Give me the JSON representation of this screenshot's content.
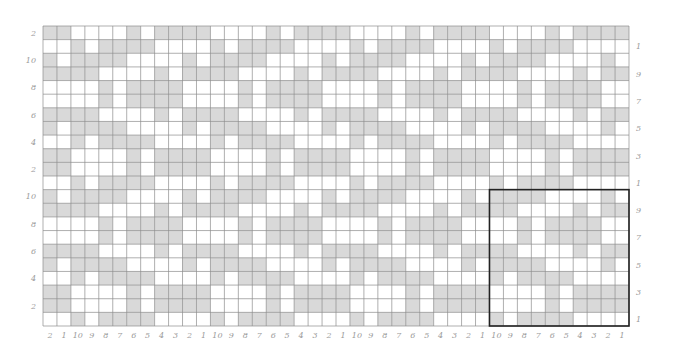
{
  "diagram": {
    "type": "weave-draft",
    "columns": 42,
    "rows": 22,
    "repeat_size": 10,
    "colors": {
      "filled": "#d9d9d9",
      "empty": "#ffffff",
      "grid_line": "#8c8c8c",
      "repeat_box": "#222222",
      "label": "#9a9a9a"
    },
    "repeat_unit_top_to_bottom": [
      "1111000010",
      "1100001011",
      "0010111100",
      "0010111100",
      "1100001011",
      "1111000010",
      "1011110000",
      "0000101111",
      "0000101111",
      "1011110000"
    ],
    "column_labels_left_to_right": [
      "2",
      "1",
      "10",
      "9",
      "8",
      "7",
      "6",
      "5",
      "4",
      "3",
      "2",
      "1",
      "10",
      "9",
      "8",
      "7",
      "6",
      "5",
      "4",
      "3",
      "2",
      "1",
      "10",
      "9",
      "8",
      "7",
      "6",
      "5",
      "4",
      "3",
      "2",
      "1",
      "10",
      "9",
      "8",
      "7",
      "6",
      "5",
      "4",
      "3",
      "2",
      "1"
    ],
    "left_row_labels_top_to_bottom": [
      "2",
      "10",
      "8",
      "6",
      "4",
      "2",
      "10",
      "8",
      "6",
      "4",
      "2"
    ],
    "right_row_labels_top_to_bottom": [
      "1",
      "9",
      "7",
      "5",
      "3",
      "1",
      "9",
      "7",
      "5",
      "3",
      "1"
    ],
    "repeat_box": {
      "columns_from_right": 10,
      "rows_from_bottom": 10
    }
  }
}
